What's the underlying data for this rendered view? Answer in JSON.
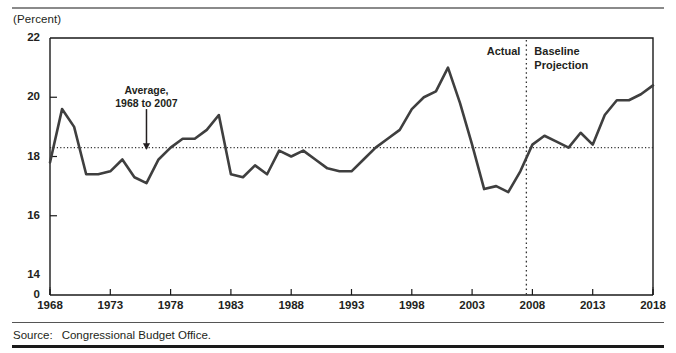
{
  "figure": {
    "unit_label": "(Percent)",
    "source_prefix": "Source:",
    "source_text": "Congressional Budget Office."
  },
  "annotations": {
    "average_line_1": "Average,",
    "average_line_2": "1968 to 2007",
    "actual": "Actual",
    "projection_line_1": "Baseline",
    "projection_line_2": "Projection"
  },
  "colors": {
    "line": "#3f3f3f",
    "text": "#231f20",
    "axis": "#1a1a1a",
    "dotted": "#333333"
  },
  "chart_data": {
    "type": "line",
    "title": "",
    "subtitle": "",
    "xlabel": "",
    "ylabel": "(Percent)",
    "ylim": [
      14,
      22
    ],
    "y_axis_break_label": "0",
    "yticks": [
      14,
      16,
      18,
      20,
      22
    ],
    "ytick_labels": [
      "14",
      "16",
      "18",
      "20",
      "22"
    ],
    "xlim": [
      1968,
      2018
    ],
    "xticks": [
      1968,
      1973,
      1978,
      1983,
      1988,
      1993,
      1998,
      2003,
      2008,
      2013,
      2018
    ],
    "xtick_labels": [
      "1968",
      "1973",
      "1978",
      "1983",
      "1988",
      "1993",
      "1998",
      "2003",
      "2008",
      "2013",
      "2018"
    ],
    "grid": false,
    "legend": "none",
    "reference_lines": [
      {
        "name": "average-1968-2007",
        "orientation": "horizontal",
        "value": 18.3,
        "style": "dotted",
        "label": "Average, 1968 to 2007"
      },
      {
        "name": "actual-projection-divider",
        "orientation": "vertical",
        "value": 2007.5,
        "style": "dotted",
        "label": "Actual | Baseline Projection"
      }
    ],
    "annotation_arrow": {
      "name": "average-arrow",
      "x": 1976,
      "y_from": 19.6,
      "y_to": 18.35
    },
    "series": [
      {
        "name": "Total outlays as a percentage of GDP",
        "x": [
          1968,
          1969,
          1970,
          1971,
          1972,
          1973,
          1974,
          1975,
          1976,
          1977,
          1978,
          1979,
          1980,
          1981,
          1982,
          1983,
          1984,
          1985,
          1986,
          1987,
          1988,
          1989,
          1990,
          1991,
          1992,
          1993,
          1994,
          1995,
          1996,
          1997,
          1998,
          1999,
          2000,
          2001,
          2002,
          2003,
          2004,
          2005,
          2006,
          2007,
          2008,
          2009,
          2010,
          2011,
          2012,
          2013,
          2014,
          2015,
          2016,
          2017,
          2018
        ],
        "values": [
          17.8,
          19.6,
          19.0,
          17.4,
          17.4,
          17.5,
          17.9,
          17.3,
          17.1,
          17.9,
          18.3,
          18.6,
          18.6,
          18.9,
          19.4,
          17.4,
          17.3,
          17.7,
          17.4,
          18.2,
          18.0,
          18.2,
          17.9,
          17.6,
          17.5,
          17.5,
          17.9,
          18.3,
          18.6,
          18.9,
          19.6,
          20.0,
          20.2,
          21.0,
          19.8,
          18.4,
          16.9,
          17.0,
          16.8,
          17.5,
          18.4,
          18.7,
          18.5,
          18.3,
          18.8,
          18.4,
          19.4,
          19.9,
          19.9,
          20.1,
          20.4
        ]
      }
    ]
  }
}
